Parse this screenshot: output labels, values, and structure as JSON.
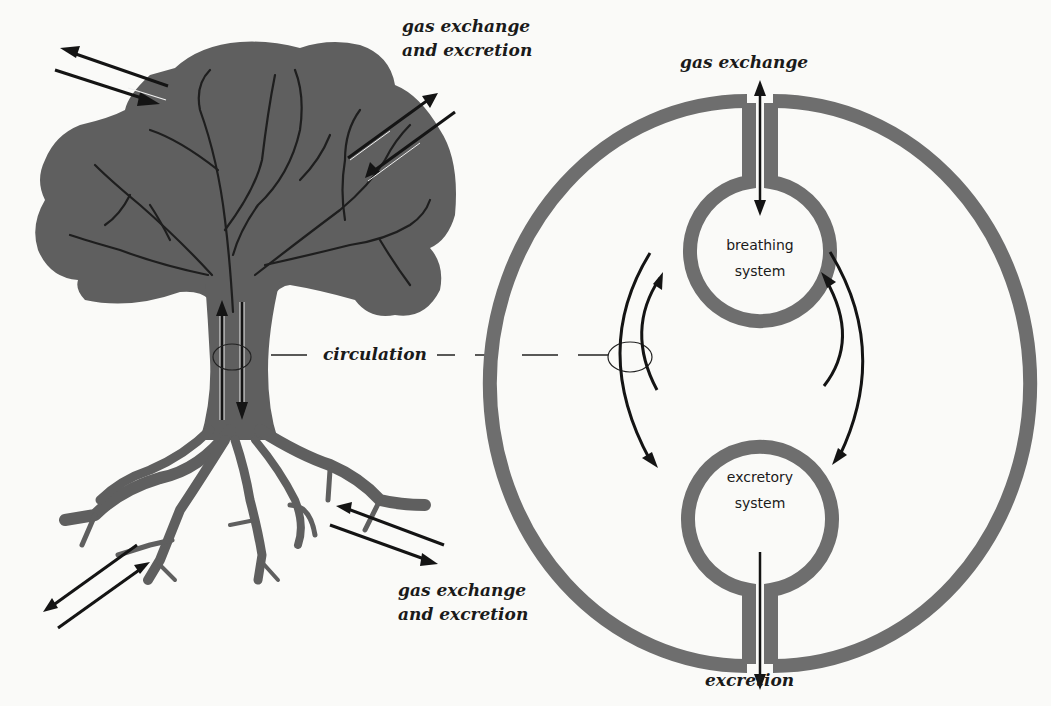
{
  "colors": {
    "background": "#fafaf8",
    "tissue_gray": "#5f5f5f",
    "ring_gray": "#6e6e6e",
    "arrow_black": "#141414",
    "text": "#1a1a1a"
  },
  "labels": {
    "tree_top_line1": "gas exchange",
    "tree_top_line2": "and excretion",
    "tree_bottom_line1": "gas exchange",
    "tree_bottom_line2": "and excretion",
    "circulation": "circulation",
    "organism_top": "gas exchange",
    "organism_bottom": "excretion",
    "breathing_line1": "breathing",
    "breathing_line2": "system",
    "excretory_line1": "excretory",
    "excretory_line2": "system"
  },
  "panels": {
    "left": "tree",
    "right": "organism-schematic"
  }
}
